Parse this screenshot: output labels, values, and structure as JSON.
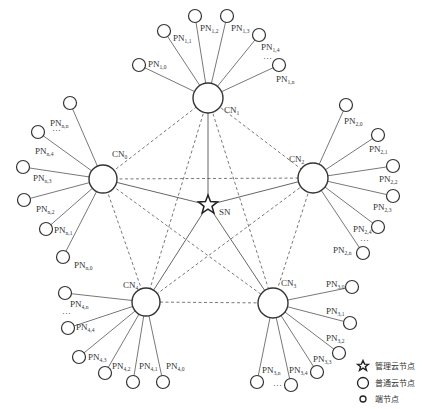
{
  "diagram": {
    "type": "network-topology",
    "colors": {
      "line": "#555555",
      "node_stroke": "#333333",
      "node_fill": "#ffffff",
      "text": "#333333"
    },
    "server": {
      "id": "SN",
      "label": "SN",
      "x": 208,
      "y": 205,
      "label_x": 219,
      "label_y": 215
    },
    "clusters": [
      {
        "id": "CN0",
        "main": "CN",
        "sub": "0",
        "x": 103,
        "y": 179,
        "r": 14,
        "label_x": 112,
        "label_y": 157,
        "peers": [
          {
            "main": "PN",
            "sub": "n,n",
            "x": 70,
            "y": 103,
            "lx": 50,
            "ly": 126
          },
          {
            "main": "PN",
            "sub": "n,4",
            "x": 38,
            "y": 132,
            "lx": 35,
            "ly": 154
          },
          {
            "main": "PN",
            "sub": "n,3",
            "x": 23,
            "y": 167,
            "lx": 33,
            "ly": 181
          },
          {
            "main": "PN",
            "sub": "n,2",
            "x": 24,
            "y": 200,
            "lx": 36,
            "ly": 212
          },
          {
            "main": "PN",
            "sub": "n,1",
            "x": 46,
            "y": 229,
            "lx": 54,
            "ly": 233
          },
          {
            "main": "PN",
            "sub": "n,0",
            "x": 63,
            "y": 257,
            "lx": 74,
            "ly": 268
          }
        ],
        "ellipsis": {
          "text": "···",
          "x": 52,
          "y": 133
        }
      },
      {
        "id": "CN1",
        "main": "CN",
        "sub": "1",
        "x": 208,
        "y": 98,
        "r": 15,
        "label_x": 224,
        "label_y": 113,
        "peers": [
          {
            "main": "PN",
            "sub": "1,0",
            "x": 139,
            "y": 65,
            "lx": 148,
            "ly": 67
          },
          {
            "main": "PN",
            "sub": "1,1",
            "x": 164,
            "y": 31,
            "lx": 173,
            "ly": 41
          },
          {
            "main": "PN",
            "sub": "1,2",
            "x": 195,
            "y": 16,
            "lx": 200,
            "ly": 31
          },
          {
            "main": "PN",
            "sub": "1,3",
            "x": 227,
            "y": 16,
            "lx": 231,
            "ly": 31
          },
          {
            "main": "PN",
            "sub": "1,4",
            "x": 259,
            "y": 35,
            "lx": 261,
            "ly": 50
          },
          {
            "main": "PN",
            "sub": "1,n",
            "x": 279,
            "y": 65,
            "lx": 276,
            "ly": 82
          }
        ],
        "ellipsis": {
          "text": "···",
          "x": 263,
          "y": 61
        }
      },
      {
        "id": "CN2",
        "main": "CN",
        "sub": "2",
        "x": 313,
        "y": 178,
        "r": 15,
        "label_x": 289,
        "label_y": 162,
        "peers": [
          {
            "main": "PN",
            "sub": "2,0",
            "x": 346,
            "y": 105,
            "lx": 344,
            "ly": 124
          },
          {
            "main": "PN",
            "sub": "2,1",
            "x": 378,
            "y": 135,
            "lx": 369,
            "ly": 152
          },
          {
            "main": "PN",
            "sub": "2,2",
            "x": 393,
            "y": 166,
            "lx": 379,
            "ly": 182
          },
          {
            "main": "PN",
            "sub": "2,3",
            "x": 393,
            "y": 196,
            "lx": 373,
            "ly": 210
          },
          {
            "main": "PN",
            "sub": "2,4",
            "x": 378,
            "y": 227,
            "lx": 353,
            "ly": 232
          },
          {
            "main": "PN",
            "sub": "2,n",
            "x": 363,
            "y": 253,
            "lx": 333,
            "ly": 253
          }
        ],
        "ellipsis": {
          "text": "···",
          "x": 360,
          "y": 243
        }
      },
      {
        "id": "CN3",
        "main": "CN",
        "sub": "3",
        "x": 273,
        "y": 303,
        "r": 15,
        "label_x": 281,
        "label_y": 286,
        "peers": [
          {
            "main": "PN",
            "sub": "3,0",
            "x": 352,
            "y": 287,
            "lx": 326,
            "ly": 287
          },
          {
            "main": "PN",
            "sub": "3,1",
            "x": 350,
            "y": 323,
            "lx": 326,
            "ly": 314
          },
          {
            "main": "PN",
            "sub": "3,2",
            "x": 339,
            "y": 353,
            "lx": 326,
            "ly": 341
          },
          {
            "main": "PN",
            "sub": "3,3",
            "x": 317,
            "y": 372,
            "lx": 313,
            "ly": 362
          },
          {
            "main": "PN",
            "sub": "3,4",
            "x": 291,
            "y": 385,
            "lx": 289,
            "ly": 373
          },
          {
            "main": "PN",
            "sub": "3,n",
            "x": 257,
            "y": 382,
            "lx": 262,
            "ly": 373
          }
        ],
        "ellipsis": {
          "text": "···",
          "x": 273,
          "y": 388
        }
      },
      {
        "id": "CN4",
        "main": "CN",
        "sub": "4",
        "x": 146,
        "y": 302,
        "r": 14,
        "label_x": 123,
        "label_y": 288,
        "peers": [
          {
            "main": "PN",
            "sub": "4,n",
            "x": 65,
            "y": 293,
            "lx": 70,
            "ly": 307
          },
          {
            "main": "PN",
            "sub": "4,4",
            "x": 68,
            "y": 328,
            "lx": 76,
            "ly": 330
          },
          {
            "main": "PN",
            "sub": "4,3",
            "x": 79,
            "y": 357,
            "lx": 88,
            "ly": 360
          },
          {
            "main": "PN",
            "sub": "4,2",
            "x": 105,
            "y": 373,
            "lx": 112,
            "ly": 369
          },
          {
            "main": "PN",
            "sub": "4,1",
            "x": 133,
            "y": 382,
            "lx": 139,
            "ly": 369
          },
          {
            "main": "PN",
            "sub": "4,0",
            "x": 163,
            "y": 382,
            "lx": 166,
            "ly": 369
          }
        ],
        "ellipsis": {
          "text": "···",
          "x": 62,
          "y": 316
        }
      }
    ],
    "links": {
      "solid_server_to_cluster": true,
      "dashed_full_mesh_between_clusters": true
    }
  },
  "legend": {
    "items": [
      {
        "symbol": "star",
        "label": "管理云节点"
      },
      {
        "symbol": "large-circle",
        "label": "普通云节点"
      },
      {
        "symbol": "small-circle",
        "label": "端节点"
      }
    ]
  }
}
